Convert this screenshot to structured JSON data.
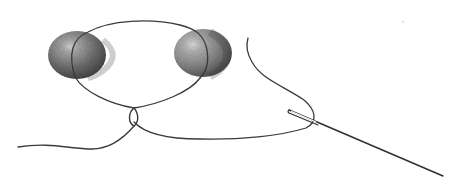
{
  "illustration": {
    "caption": "Pencil sketch: two beads on a thread loop tied with a knot, thread ending in a sewing needle",
    "colors": {
      "background": "#ffffff",
      "thread": "#3a3a3a",
      "bead_light": "#b8b8b8",
      "bead_dark": "#4a4a4a",
      "needle": "#2e2e2e"
    },
    "elements": {
      "bead_left": {
        "cx": 77,
        "cy": 55,
        "rx": 29,
        "ry": 24
      },
      "bead_right": {
        "cx": 203,
        "cy": 53,
        "rx": 29,
        "ry": 24
      },
      "knot": {
        "x": 134,
        "y": 112
      },
      "needle": {
        "eye_x": 290,
        "eye_y": 112,
        "tip_x": 443,
        "tip_y": 176
      }
    }
  }
}
